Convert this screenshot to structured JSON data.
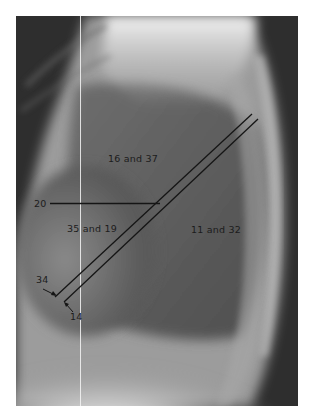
{
  "figure": {
    "labels": {
      "upper_region": "16 and 37",
      "left_region": "35 and 19",
      "right_region": "11 and 32",
      "horizontal_line": "20",
      "upper_diagonal": "34",
      "lower_diagonal": "14"
    },
    "colors": {
      "annotation": "#1a1a1a",
      "background": "#ffffff"
    }
  }
}
